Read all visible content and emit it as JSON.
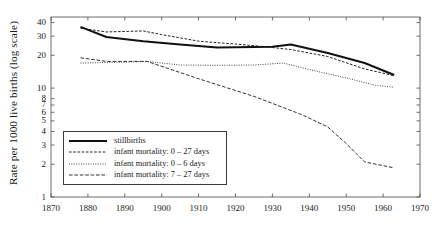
{
  "chart_data": {
    "type": "line",
    "title": "",
    "xlabel": "",
    "ylabel": "Rate per 1000 live births (log scale)",
    "yscale": "log",
    "xlim": [
      1870,
      1970
    ],
    "ylim": [
      1,
      45
    ],
    "grid": false,
    "legend_position": "lower-left-inside",
    "xticks": [
      1870,
      1880,
      1890,
      1900,
      1910,
      1920,
      1930,
      1940,
      1950,
      1960,
      1970
    ],
    "xtick_labels": [
      "1870",
      "1880",
      "1890",
      "1900",
      "1910",
      "1920",
      "1930",
      "1940",
      "1950",
      "1960",
      "1970"
    ],
    "yticks": [
      1,
      2,
      3,
      4,
      5,
      6,
      7,
      8,
      10,
      20,
      30,
      40
    ],
    "ytick_labels": [
      "1",
      "2",
      "3",
      "4",
      "5",
      "6",
      "7",
      "8",
      "10",
      "20",
      "30",
      "40"
    ],
    "series": [
      {
        "name": "stillbirths",
        "style": "solid",
        "width": 2.0,
        "color": "#111111",
        "x": [
          1878,
          1885,
          1895,
          1905,
          1915,
          1925,
          1930,
          1935,
          1945,
          1955,
          1963
        ],
        "y": [
          36.5,
          29.5,
          27.0,
          25.2,
          23.6,
          23.8,
          24.0,
          25.2,
          21.0,
          17.0,
          13.2
        ]
      },
      {
        "name": "infant mortality: 0 – 27 days",
        "style": "dashed",
        "width": 1.0,
        "color": "#222222",
        "x": [
          1878,
          1885,
          1895,
          1900,
          1910,
          1920,
          1928,
          1935,
          1945,
          1955,
          1963
        ],
        "y": [
          35.5,
          32.8,
          33.5,
          31.0,
          27.0,
          25.4,
          24.0,
          22.6,
          19.5,
          15.0,
          13.0
        ]
      },
      {
        "name": "infant mortality: 0 – 6 days",
        "style": "dotted",
        "width": 1.0,
        "color": "#333333",
        "x": [
          1878,
          1885,
          1890,
          1896,
          1905,
          1915,
          1925,
          1933,
          1940,
          1950,
          1958,
          1963
        ],
        "y": [
          17.0,
          17.2,
          17.3,
          17.6,
          16.3,
          16.2,
          16.3,
          17.0,
          14.8,
          12.4,
          10.6,
          10.2
        ]
      },
      {
        "name": "infant mortality: 7 – 27 days",
        "style": "dashdot",
        "width": 1.0,
        "color": "#333333",
        "x": [
          1878,
          1885,
          1896,
          1910,
          1925,
          1938,
          1945,
          1950,
          1955,
          1963
        ],
        "y": [
          19.0,
          17.6,
          17.6,
          12.2,
          8.4,
          5.7,
          4.4,
          3.1,
          2.1,
          1.85
        ]
      }
    ]
  },
  "legend": {
    "items": [
      {
        "label": "stillbirths",
        "style": "solid"
      },
      {
        "label": "infant mortality: 0 – 27 days",
        "style": "dashed"
      },
      {
        "label": "infant mortality: 0 – 6 days",
        "style": "dotted"
      },
      {
        "label": "infant mortality: 7 – 27 days",
        "style": "dashdot"
      }
    ]
  },
  "axes": {
    "ylabel": "Rate per 1000 live births (log scale)",
    "frame_color": "#4a4a4a"
  }
}
